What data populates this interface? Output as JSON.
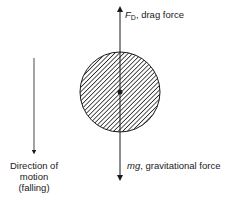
{
  "diagram": {
    "drag_force": {
      "symbol": "F",
      "subscript": "D",
      "text": ", drag force"
    },
    "gravity_force": {
      "symbol": "mg",
      "text": ", gravitational force"
    },
    "motion_label": {
      "line1": "Direction of",
      "line2": "motion",
      "line3": "(falling)"
    },
    "colors": {
      "ink": "#1a1a1a",
      "background": "#ffffff"
    }
  }
}
